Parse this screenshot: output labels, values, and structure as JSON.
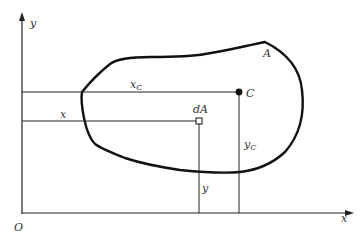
{
  "diagram": {
    "axes": {
      "x_label": "x",
      "y_label": "y",
      "origin_label": "O"
    },
    "region_label": "A",
    "centroid": {
      "label": "C",
      "x_label": "x",
      "x_sub": "C",
      "y_label": "y",
      "y_sub": "C"
    },
    "element": {
      "label": "dA",
      "x_label": "x",
      "y_label": "y"
    },
    "colors": {
      "line": "#222222",
      "outline": "#111111"
    }
  }
}
